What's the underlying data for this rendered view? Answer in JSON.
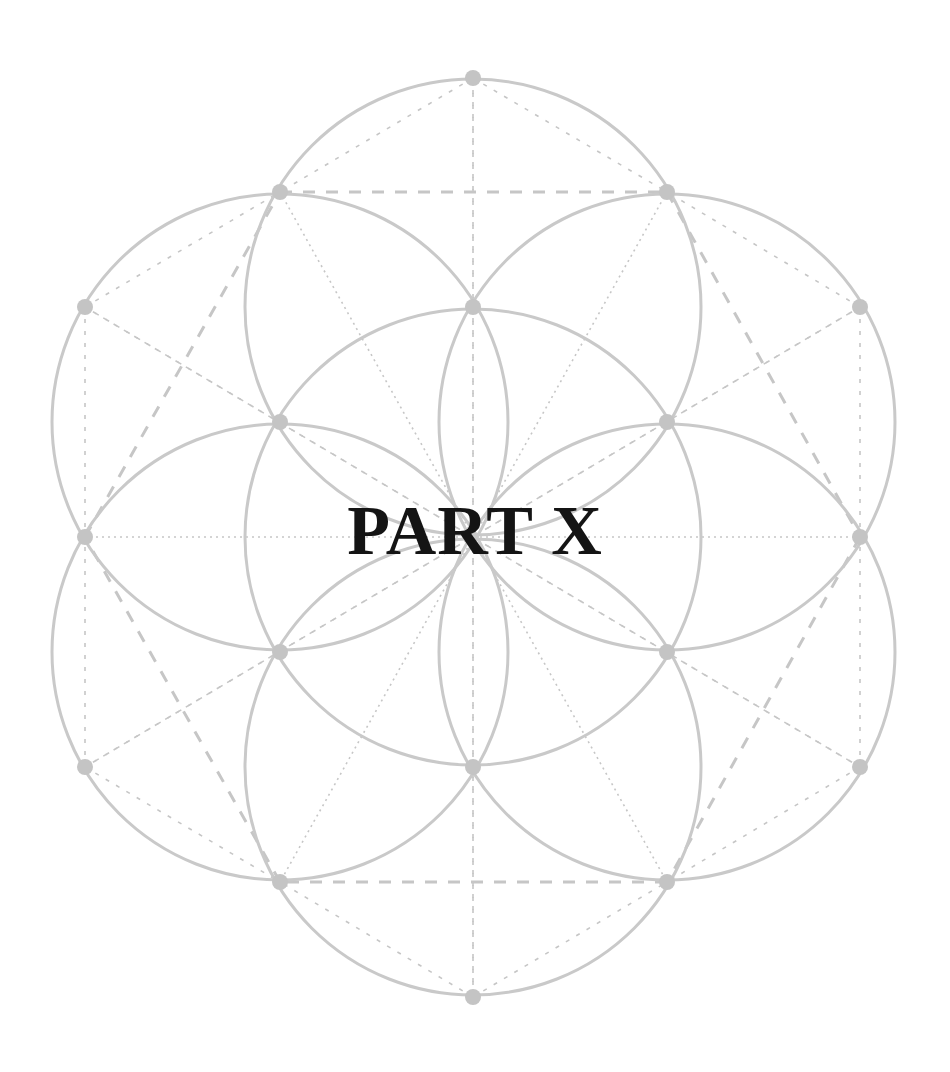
{
  "title": "PART X",
  "colors": {
    "background": "#ffffff",
    "stroke": "#c9c9c9",
    "node": "#c4c4c4",
    "text": "#141414"
  },
  "geometry": {
    "center": [
      473,
      537
    ],
    "radius": 228,
    "circles": [
      {
        "cx": 473,
        "cy": 537
      },
      {
        "cx": 473,
        "cy": 307
      },
      {
        "cx": 667,
        "cy": 422
      },
      {
        "cx": 667,
        "cy": 652
      },
      {
        "cx": 473,
        "cy": 767
      },
      {
        "cx": 280,
        "cy": 652
      },
      {
        "cx": 280,
        "cy": 422
      }
    ],
    "nodes": {
      "inner": [
        [
          473,
          307
        ],
        [
          667,
          422
        ],
        [
          667,
          652
        ],
        [
          473,
          767
        ],
        [
          280,
          652
        ],
        [
          280,
          422
        ]
      ],
      "big_hex": [
        [
          280,
          192
        ],
        [
          667,
          192
        ],
        [
          860,
          537
        ],
        [
          667,
          882
        ],
        [
          280,
          882
        ],
        [
          85,
          537
        ]
      ],
      "outer": [
        [
          473,
          78
        ],
        [
          860,
          307
        ],
        [
          860,
          767
        ],
        [
          473,
          997
        ],
        [
          85,
          767
        ],
        [
          85,
          307
        ]
      ]
    }
  }
}
